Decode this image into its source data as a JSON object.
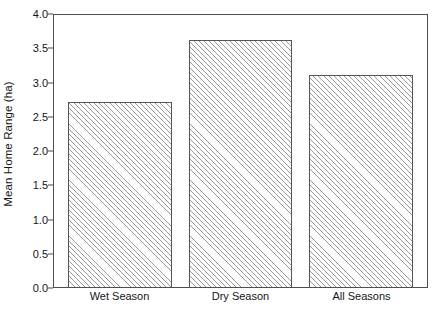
{
  "chart_data": {
    "type": "bar",
    "title": "",
    "xlabel": "",
    "ylabel": "Mean Home Range (ha)",
    "categories": [
      "Wet Season",
      "Dry Season",
      "All Seasons"
    ],
    "values": [
      2.7,
      3.6,
      3.1
    ],
    "ylim": [
      0.0,
      4.0
    ],
    "ytick_values": [
      0.0,
      0.5,
      1.0,
      1.5,
      2.0,
      2.5,
      3.0,
      3.5,
      4.0
    ],
    "ytick_labels": [
      "0.0",
      "0.5",
      "1.0",
      "1.5",
      "2.0",
      "2.5",
      "3.0",
      "3.5",
      "4.0"
    ],
    "grid": false,
    "legend": null,
    "bar_fill": "diagonal-hatch",
    "bar_fill_color": "#9a9a9a",
    "bar_edge_color": "#555555",
    "frame_color": "#4f4f4f",
    "background_color": "#ffffff",
    "text_color": "#161616"
  }
}
